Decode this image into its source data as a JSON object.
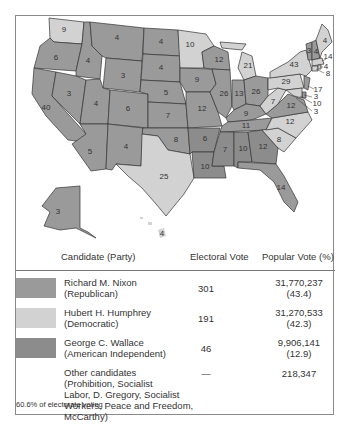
{
  "colors": {
    "republican": "#9a9a9a",
    "democratic": "#d2d2d2",
    "american_independent": "#8c8c8c",
    "border": "#333333",
    "frame": "#8a8a8a"
  },
  "map": {
    "states": [
      {
        "name": "Washington",
        "ev": "9",
        "winner": "democratic"
      },
      {
        "name": "Oregon",
        "ev": "6",
        "winner": "republican"
      },
      {
        "name": "California",
        "ev": "40",
        "winner": "republican"
      },
      {
        "name": "Idaho",
        "ev": "4",
        "winner": "republican"
      },
      {
        "name": "Nevada",
        "ev": "3",
        "winner": "republican"
      },
      {
        "name": "Montana",
        "ev": "4",
        "winner": "republican"
      },
      {
        "name": "Wyoming",
        "ev": "3",
        "winner": "republican"
      },
      {
        "name": "Utah",
        "ev": "4",
        "winner": "republican"
      },
      {
        "name": "Arizona",
        "ev": "5",
        "winner": "republican"
      },
      {
        "name": "Colorado",
        "ev": "6",
        "winner": "republican"
      },
      {
        "name": "New Mexico",
        "ev": "4",
        "winner": "republican"
      },
      {
        "name": "North Dakota",
        "ev": "4",
        "winner": "republican"
      },
      {
        "name": "South Dakota",
        "ev": "4",
        "winner": "republican"
      },
      {
        "name": "Nebraska",
        "ev": "5",
        "winner": "republican"
      },
      {
        "name": "Kansas",
        "ev": "7",
        "winner": "republican"
      },
      {
        "name": "Oklahoma",
        "ev": "8",
        "winner": "republican"
      },
      {
        "name": "Texas",
        "ev": "25",
        "winner": "democratic"
      },
      {
        "name": "Minnesota",
        "ev": "10",
        "winner": "democratic"
      },
      {
        "name": "Iowa",
        "ev": "9",
        "winner": "republican"
      },
      {
        "name": "Missouri",
        "ev": "12",
        "winner": "republican"
      },
      {
        "name": "Arkansas",
        "ev": "6",
        "winner": "american_independent"
      },
      {
        "name": "Louisiana",
        "ev": "10",
        "winner": "american_independent"
      },
      {
        "name": "Wisconsin",
        "ev": "12",
        "winner": "republican"
      },
      {
        "name": "Illinois",
        "ev": "26",
        "winner": "republican"
      },
      {
        "name": "Michigan",
        "ev": "21",
        "winner": "democratic"
      },
      {
        "name": "Indiana",
        "ev": "13",
        "winner": "republican"
      },
      {
        "name": "Ohio",
        "ev": "26",
        "winner": "republican"
      },
      {
        "name": "Kentucky",
        "ev": "9",
        "winner": "republican"
      },
      {
        "name": "Tennessee",
        "ev": "11",
        "winner": "republican"
      },
      {
        "name": "Mississippi",
        "ev": "7",
        "winner": "american_independent"
      },
      {
        "name": "Alabama",
        "ev": "10",
        "winner": "american_independent"
      },
      {
        "name": "Georgia",
        "ev": "12",
        "winner": "american_independent"
      },
      {
        "name": "Florida",
        "ev": "14",
        "winner": "republican"
      },
      {
        "name": "South Carolina",
        "ev": "8",
        "winner": "republican"
      },
      {
        "name": "North Carolina",
        "ev": "12",
        "winner": "republican"
      },
      {
        "name": "Virginia",
        "ev": "12",
        "winner": "republican"
      },
      {
        "name": "West Virginia",
        "ev": "7",
        "winner": "democratic"
      },
      {
        "name": "Pennsylvania",
        "ev": "29",
        "winner": "democratic"
      },
      {
        "name": "New York",
        "ev": "43",
        "winner": "democratic"
      },
      {
        "name": "Vermont",
        "ev": "3",
        "winner": "republican"
      },
      {
        "name": "New Hampshire",
        "ev": "4",
        "winner": "republican"
      },
      {
        "name": "Maine",
        "ev": "4",
        "winner": "democratic"
      },
      {
        "name": "Massachusetts",
        "ev": "14",
        "winner": "democratic"
      },
      {
        "name": "Rhode Island",
        "ev": "4",
        "winner": "democratic"
      },
      {
        "name": "Connecticut",
        "ev": "8",
        "winner": "democratic"
      },
      {
        "name": "New Jersey",
        "ev": "17",
        "winner": "republican"
      },
      {
        "name": "Delaware",
        "ev": "3",
        "winner": "republican"
      },
      {
        "name": "Maryland",
        "ev": "10",
        "winner": "democratic"
      },
      {
        "name": "District of Columbia",
        "ev": "3",
        "winner": "democratic"
      },
      {
        "name": "Alaska",
        "ev": "3",
        "winner": "republican"
      },
      {
        "name": "Hawaii",
        "ev": "4",
        "winner": "democratic"
      }
    ]
  },
  "table": {
    "headers": {
      "candidate": "Candidate (Party)",
      "electoral_vote": "Electoral Vote",
      "popular_vote": "Popular Vote (%)"
    },
    "rows": [
      {
        "name": "Richard M. Nixon",
        "party": "(Republican)",
        "ev": "301",
        "pv": "31,770,237",
        "pct": "(43.4)",
        "color": "#9a9a9a"
      },
      {
        "name": "Hubert H. Humphrey",
        "party": "(Democratic)",
        "ev": "191",
        "pv": "31,270,533",
        "pct": "(42.3)",
        "color": "#d2d2d2"
      },
      {
        "name": "George C. Wallace",
        "party": "(American Independent)",
        "ev": "46",
        "pv": "9,906,141",
        "pct": "(12.9)",
        "color": "#8c8c8c"
      },
      {
        "name": "Other candidates",
        "party_lines": [
          "(Prohibition, Socialist",
          "Labor, D. Gregory, Socialist",
          "Workers, Peace and Freedom,",
          "McCarthy)"
        ],
        "ev": "—",
        "pv": "218,347",
        "pct": ""
      }
    ],
    "footer": "60.6% of electorate voting"
  }
}
